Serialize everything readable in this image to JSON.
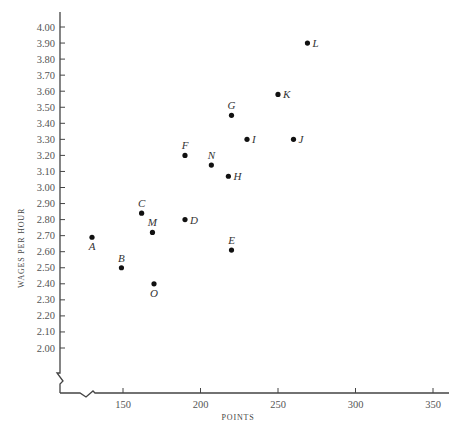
{
  "chart_data": {
    "type": "scatter",
    "title": "",
    "xlabel": "POINTS",
    "ylabel": "WAGES PER HOUR",
    "xlim": [
      115,
      360
    ],
    "ylim": [
      1.85,
      4.05
    ],
    "x_ticks": [
      "150",
      "200",
      "250",
      "300",
      "350"
    ],
    "y_ticks": [
      "4.00",
      "3.90",
      "3.80",
      "3.70",
      "3.60",
      "3.50",
      "3.40",
      "3.30",
      "3.20",
      "3.10",
      "3.00",
      "2.90",
      "2.80",
      "2.70",
      "2.60",
      "2.50",
      "2.40",
      "2.30",
      "2.20",
      "2.10",
      "2.00"
    ],
    "grid": false,
    "legend": null,
    "axis_breaks": [
      "x",
      "y"
    ],
    "points": [
      {
        "label": "A",
        "x": 130,
        "y": 2.69,
        "label_pos": "below"
      },
      {
        "label": "B",
        "x": 149,
        "y": 2.5,
        "label_pos": "above"
      },
      {
        "label": "C",
        "x": 162,
        "y": 2.84,
        "label_pos": "above"
      },
      {
        "label": "D",
        "x": 190,
        "y": 2.8,
        "label_pos": "right"
      },
      {
        "label": "E",
        "x": 220,
        "y": 2.61,
        "label_pos": "above"
      },
      {
        "label": "F",
        "x": 190,
        "y": 3.2,
        "label_pos": "above"
      },
      {
        "label": "G",
        "x": 220,
        "y": 3.45,
        "label_pos": "above"
      },
      {
        "label": "H",
        "x": 218,
        "y": 3.07,
        "label_pos": "right"
      },
      {
        "label": "I",
        "x": 230,
        "y": 3.3,
        "label_pos": "right"
      },
      {
        "label": "J",
        "x": 260,
        "y": 3.3,
        "label_pos": "right"
      },
      {
        "label": "K",
        "x": 250,
        "y": 3.58,
        "label_pos": "right"
      },
      {
        "label": "L",
        "x": 269,
        "y": 3.9,
        "label_pos": "right"
      },
      {
        "label": "M",
        "x": 169,
        "y": 2.72,
        "label_pos": "above"
      },
      {
        "label": "N",
        "x": 207,
        "y": 3.14,
        "label_pos": "above"
      },
      {
        "label": "O",
        "x": 170,
        "y": 2.4,
        "label_pos": "below"
      }
    ]
  }
}
